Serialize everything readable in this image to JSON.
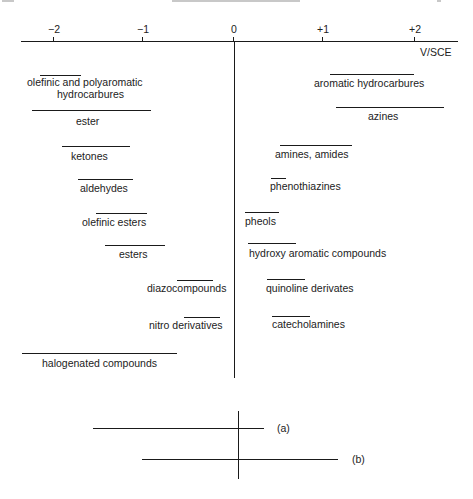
{
  "header": {
    "cropped": true
  },
  "axis": {
    "unit_label": "V/SCE",
    "ticks": [
      {
        "label": "−2",
        "x": 53
      },
      {
        "label": "−1",
        "x": 142
      },
      {
        "label": "0",
        "x": 233
      },
      {
        "label": "+1",
        "x": 322
      },
      {
        "label": "+2",
        "x": 414
      }
    ]
  },
  "chart_data": {
    "type": "range-diagram",
    "title": "",
    "xlabel": "V/SCE",
    "xlim": [
      -2.2,
      2.5
    ],
    "tick_labels": [
      "−2",
      "−1",
      "0",
      "+1",
      "+2"
    ],
    "reduction_side": [
      {
        "name": "olefinic and polyaromatic hydrocarbures",
        "range": [
          -1.85,
          -1.4
        ]
      },
      {
        "name": "ester",
        "range": [
          -2.25,
          -0.9
        ]
      },
      {
        "name": "ketones",
        "range": [
          -1.9,
          -1.15
        ]
      },
      {
        "name": "aldehydes",
        "range": [
          -1.7,
          -1.1
        ]
      },
      {
        "name": "olefinic esters",
        "range": [
          -1.5,
          -0.95
        ]
      },
      {
        "name": "esters",
        "range": [
          -1.4,
          -0.75
        ]
      },
      {
        "name": "diazocompounds",
        "range": [
          -0.6,
          -0.2
        ]
      },
      {
        "name": "nitro derivatives",
        "range": [
          -0.55,
          -0.15
        ]
      },
      {
        "name": "halogenated compounds",
        "range": [
          -2.3,
          -0.6
        ]
      }
    ],
    "oxidation_side": [
      {
        "name": "aromatic hydrocarbures",
        "range": [
          1.1,
          2.0
        ]
      },
      {
        "name": "azines",
        "range": [
          1.15,
          2.3
        ]
      },
      {
        "name": "amines, amides",
        "range": [
          0.5,
          1.3
        ]
      },
      {
        "name": "phenothiazines",
        "range": [
          0.4,
          0.55
        ]
      },
      {
        "name": "pheols",
        "range": [
          0.12,
          0.5
        ]
      },
      {
        "name": "hydroxy aromatic compounds",
        "range": [
          0.15,
          0.7
        ]
      },
      {
        "name": "quinoline derivates",
        "range": [
          0.37,
          0.8
        ]
      },
      {
        "name": "catecholamines",
        "range": [
          0.42,
          0.85
        ]
      }
    ],
    "inset": [
      {
        "label": "(a)",
        "range_px": [
          93,
          264
        ]
      },
      {
        "label": "(b)",
        "range_px": [
          142,
          338
        ]
      }
    ]
  },
  "items": [
    {
      "label": "olefinic and polyaromatic",
      "label2": "hydrocarbures",
      "line": [
        40,
        81,
        75
      ],
      "text": [
        27,
        76
      ],
      "text2": [
        57,
        88
      ]
    },
    {
      "label": "ester",
      "line": [
        32,
        151,
        110
      ],
      "text": [
        76,
        115
      ]
    },
    {
      "label": "ketones",
      "line": [
        62,
        130,
        146
      ],
      "text": [
        71,
        150
      ]
    },
    {
      "label": "aldehydes",
      "line": [
        78,
        133,
        179
      ],
      "text": [
        80,
        182
      ]
    },
    {
      "label": "olefinic esters",
      "line": [
        96,
        147,
        213
      ],
      "text": [
        82,
        216
      ]
    },
    {
      "label": "esters",
      "line": [
        105,
        165,
        245
      ],
      "text": [
        119,
        248
      ]
    },
    {
      "label": "diazocompounds",
      "line": [
        177,
        213,
        280
      ],
      "text": [
        147,
        282
      ]
    },
    {
      "label": "nitro derivatives",
      "line": [
        184,
        220,
        317
      ],
      "text": [
        149,
        319
      ]
    },
    {
      "label": "halogenated compounds",
      "line": [
        22,
        177,
        353
      ],
      "text": [
        42,
        357
      ]
    },
    {
      "label": "aromatic hydrocarbures",
      "line": [
        330,
        414,
        74
      ],
      "text": [
        314,
        77
      ]
    },
    {
      "label": "azines",
      "line": [
        336,
        444,
        107
      ],
      "text": [
        368,
        110
      ]
    },
    {
      "label": "amines, amides",
      "line": [
        280,
        352,
        145
      ],
      "text": [
        275,
        148
      ]
    },
    {
      "label": "phenothiazines",
      "line": [
        271,
        286,
        178
      ],
      "text": [
        270,
        180
      ]
    },
    {
      "label": "pheols",
      "line": [
        245,
        279,
        212
      ],
      "text": [
        245,
        215
      ]
    },
    {
      "label": "hydroxy aromatic compounds",
      "line": [
        248,
        296,
        243
      ],
      "text": [
        249,
        247
      ]
    },
    {
      "label": "quinoline derivates",
      "line": [
        267,
        305,
        279
      ],
      "text": [
        266,
        282
      ]
    },
    {
      "label": "catecholamines",
      "line": [
        272,
        310,
        316
      ],
      "text": [
        272,
        318
      ]
    }
  ],
  "inset": {
    "label_a": "(a)",
    "label_b": "(b)"
  }
}
